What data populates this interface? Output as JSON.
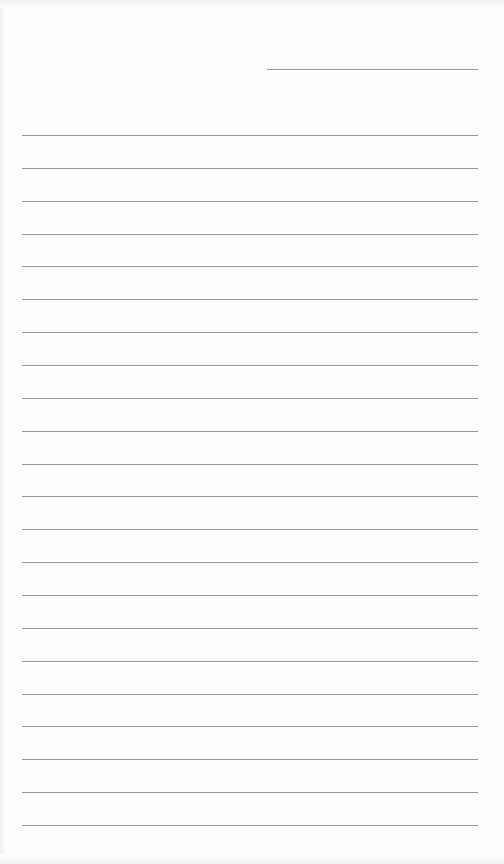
{
  "page": {
    "type": "lined-paper",
    "background": "#fefefe",
    "line_color": "#9a9a9a",
    "header_line": {
      "x": 267,
      "y": 69,
      "width": 211
    },
    "ruled_lines": {
      "count": 22,
      "x": 22,
      "width": 456,
      "first_y": 135,
      "spacing": 32.86
    }
  }
}
